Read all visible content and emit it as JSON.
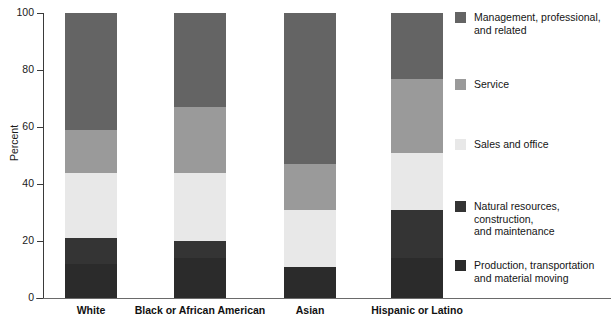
{
  "chart_data": {
    "type": "bar",
    "title": "",
    "subtitle": "",
    "xlabel": "",
    "ylabel": "Percent",
    "ylim": [
      0,
      100
    ],
    "yticks": [
      0,
      20,
      40,
      60,
      80,
      100
    ],
    "ytick_labels": [
      "0",
      "20",
      "40",
      "60",
      "80",
      "100"
    ],
    "grid": false,
    "stacked": true,
    "legend_position": "right",
    "categories": [
      "White",
      "Black or African American",
      "Asian",
      "Hispanic or Latino"
    ],
    "series": [
      {
        "name": "Production, transportation\nand material moving",
        "color": "#2b2b2b",
        "values": [
          12,
          14,
          11,
          14
        ]
      },
      {
        "name": "Natural resources,\nconstruction,\nand maintenance",
        "color": "#343434",
        "values": [
          9,
          6,
          0,
          17
        ]
      },
      {
        "name": "Sales and office",
        "color": "#e8e8e8",
        "values": [
          23,
          24,
          20,
          20
        ]
      },
      {
        "name": "Service",
        "color": "#9a9a9a",
        "values": [
          15,
          23,
          16,
          26
        ]
      },
      {
        "name": "Management, professional,\nand related",
        "color": "#646464",
        "values": [
          41,
          33,
          53,
          23
        ]
      }
    ]
  },
  "legend": {
    "entries": [
      {
        "label": "Management, professional,\nand related",
        "color": "#646464",
        "top": 0
      },
      {
        "label": "Service",
        "color": "#9a9a9a",
        "top": 67
      },
      {
        "label": "Sales and office",
        "color": "#e8e8e8",
        "top": 127
      },
      {
        "label": "Natural resources,\nconstruction,\nand maintenance",
        "color": "#343434",
        "top": 189
      },
      {
        "label": "Production, transportation\nand material moving",
        "color": "#2b2b2b",
        "top": 248
      }
    ]
  },
  "axis": {
    "y_title": "Percent",
    "y_ticks": [
      "100",
      "80",
      "60",
      "40",
      "20",
      "0"
    ]
  },
  "x_labels": [
    {
      "label": "White",
      "center": 91
    },
    {
      "label": "Black or African American",
      "center": 200
    },
    {
      "label": "Asian",
      "center": 310
    },
    {
      "label": "Hispanic or Latino",
      "center": 417
    }
  ]
}
